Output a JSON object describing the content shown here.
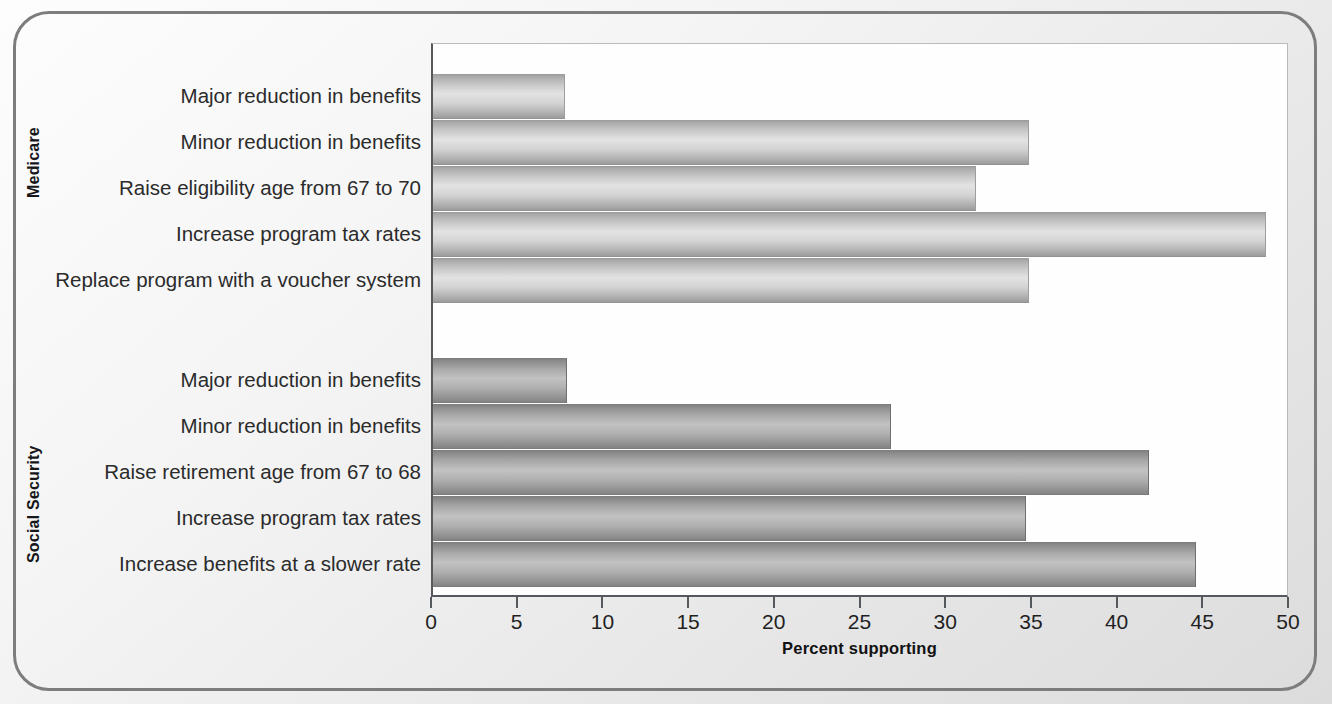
{
  "chart_data": {
    "type": "bar",
    "orientation": "horizontal",
    "title": "",
    "subtitle": "",
    "xlabel": "Percent supporting",
    "ylabel": "",
    "xlim": [
      0,
      50
    ],
    "xticks": [
      0,
      5,
      10,
      15,
      20,
      25,
      30,
      35,
      40,
      45,
      50
    ],
    "xtick_labels": [
      "0",
      "5",
      "10",
      "15",
      "20",
      "25",
      "30",
      "35",
      "40",
      "45",
      "50"
    ],
    "grid": false,
    "legend": false,
    "groups": [
      {
        "name": "Medicare",
        "categories": [
          "Major reduction in benefits",
          "Minor reduction in benefits",
          "Raise eligibility age from 67 to 70",
          "Increase program tax rates",
          "Replace program with a voucher system"
        ],
        "values": [
          7.7,
          34.8,
          31.7,
          48.6,
          34.8
        ]
      },
      {
        "name": "Social Security",
        "categories": [
          "Major reduction in benefits",
          "Minor reduction in benefits",
          "Raise retirement age from 67 to 68",
          "Increase program tax rates",
          "Increase benefits at a slower rate"
        ],
        "values": [
          7.8,
          26.7,
          41.8,
          34.6,
          44.5
        ]
      }
    ],
    "bar_color_light": "#c9c9c9",
    "bar_color_dark": "#a4a4a4",
    "axis_color": "#55585c",
    "frame_color": "#7d7d7d",
    "plot_background": "#fefefe",
    "figure_background": "#e8e8e8"
  }
}
